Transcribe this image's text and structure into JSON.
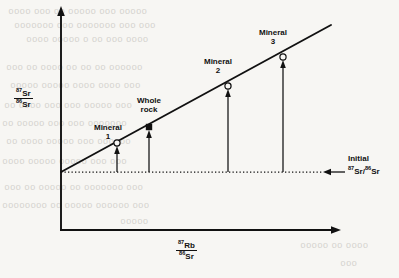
{
  "figure": {
    "kind": "rb-sr-isochron-diagram",
    "background_color": "#f7f6f3",
    "ink_color": "#111111"
  },
  "axes": {
    "y": {
      "label_numerator": "Sr",
      "label_numerator_sup": "87",
      "label_denominator": "Sr",
      "label_denominator_sup": "86",
      "label_plain": "87Sr/86Sr"
    },
    "x": {
      "label_numerator": "Rb",
      "label_numerator_sup": "87",
      "label_denominator": "Sr",
      "label_denominator_sup": "86",
      "label_plain": "87Rb/86Sr"
    }
  },
  "annotations": {
    "initial": {
      "line1": "Initial",
      "line2_sup_a": "87",
      "line2_a": "Sr",
      "line2_slash": "/",
      "line2_sup_b": "86",
      "line2_b": "Sr",
      "plain": "Initial 87Sr/86Sr"
    }
  },
  "data_points": [
    {
      "name": "Mineral 1",
      "label_line1": "Mineral",
      "label_line2": "1",
      "marker": "open-circle",
      "x": 117,
      "y": 143
    },
    {
      "name": "Whole rock",
      "label_line1": "Whole",
      "label_line2": "rock",
      "marker": "filled-square",
      "x": 149,
      "y": 127
    },
    {
      "name": "Mineral 2",
      "label_line1": "Mineral",
      "label_line2": "2",
      "marker": "open-circle",
      "x": 228,
      "y": 86
    },
    {
      "name": "Mineral 3",
      "label_line1": "Mineral",
      "label_line2": "3",
      "marker": "open-circle",
      "x": 283,
      "y": 57
    }
  ],
  "chart_data": {
    "type": "scatter",
    "title": "",
    "xlabel": "87Rb/86Sr",
    "ylabel": "87Sr/86Sr",
    "grid": false,
    "legend": "none",
    "series": [
      {
        "name": "Isochron",
        "type": "line",
        "points": [
          [
            0,
            0
          ],
          [
            1,
            1
          ]
        ],
        "note": "straight isochron line from the initial ratio intercept on the y-axis rising to the upper right"
      },
      {
        "name": "Samples",
        "type": "scatter",
        "labels": [
          "Mineral 1",
          "Whole rock",
          "Mineral 2",
          "Mineral 3"
        ],
        "markers": [
          "open-circle",
          "filled-square",
          "open-circle",
          "open-circle"
        ],
        "x": [
          0.2,
          0.32,
          0.65,
          0.87
        ],
        "y": [
          0.25,
          0.36,
          0.64,
          0.85
        ]
      }
    ],
    "annotations": [
      {
        "text": "Initial 87Sr/86Sr",
        "kind": "horizontal-dotted-line-with-arrow",
        "y": 0.0
      }
    ],
    "axis_ranges": {
      "x": [
        0,
        1
      ],
      "y": [
        0,
        1
      ]
    },
    "tick_labels": {
      "x": [],
      "y": []
    }
  },
  "bleed_through_lines": [
    {
      "text": "ooooo ooo ooooo oo ooo oooo",
      "left": 8,
      "top": 6
    },
    {
      "text": "ooo ooo ooooooo ooo ooooooo",
      "left": 14,
      "top": 20
    },
    {
      "text": "oooo ooo oo o ooooo oooo",
      "left": 26,
      "top": 34
    },
    {
      "text": "oooooo oo oo oo oooo oo ooo",
      "left": 6,
      "top": 62
    },
    {
      "text": "ooo oooo oooo ooooo ooooo",
      "left": 10,
      "top": 80
    },
    {
      "text": "ooo ooooo ooo ooo oooo oo",
      "left": 4,
      "top": 100
    },
    {
      "text": "ooooooo ooo ooo ooooo oo",
      "left": 2,
      "top": 118
    },
    {
      "text": "oooooo ooo ooooo oooo oo",
      "left": 6,
      "top": 136
    },
    {
      "text": "ooo ooo ooooo ooooo oooo",
      "left": 2,
      "top": 156
    },
    {
      "text": "ooo ooooooo oo ooooo oo ooo",
      "left": 4,
      "top": 182
    },
    {
      "text": "ooo oooooo ooooo oo oooooooo",
      "left": 2,
      "top": 200
    },
    {
      "text": "ooooo",
      "left": 120,
      "top": 216
    },
    {
      "text": "oooo oo ooooo",
      "left": 300,
      "top": 240
    },
    {
      "text": "ooo",
      "left": 340,
      "top": 258
    }
  ]
}
